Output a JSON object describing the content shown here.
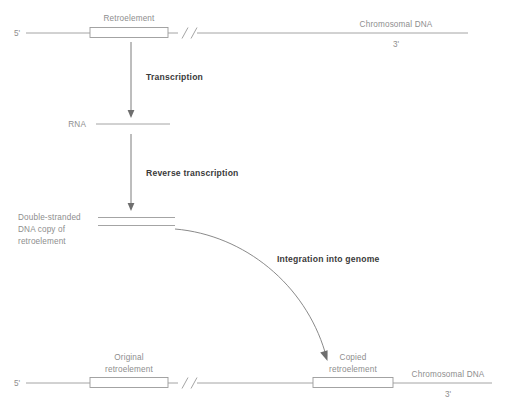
{
  "diagram": {
    "colors": {
      "strand": "#9a9a9a",
      "text_light": "#8e8e8e",
      "text_step": "#3a3a3a",
      "arrow": "#6e6e6e",
      "background": "#ffffff"
    },
    "top_row": {
      "five_prime": "5'",
      "three_prime": "3'",
      "element_label": "Retroelement",
      "chromosome_label": "Chromosomal DNA",
      "break_symbol": "//"
    },
    "steps": [
      {
        "label": "Transcription"
      },
      {
        "label": "Reverse transcription"
      },
      {
        "label": "Integration into genome"
      }
    ],
    "rna_row": {
      "label": "RNA"
    },
    "dna_copy": {
      "label_line1": "Double-stranded",
      "label_line2": "DNA copy of",
      "label_line3": "retroelement"
    },
    "bottom_row": {
      "five_prime": "5'",
      "three_prime": "3'",
      "original_label_line1": "Original",
      "original_label_line2": "retroelement",
      "copied_label_line1": "Copied",
      "copied_label_line2": "retroelement",
      "chromosome_label": "Chromosomal DNA",
      "break_symbol": "//"
    }
  }
}
